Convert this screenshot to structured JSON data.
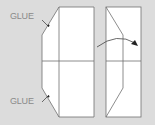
{
  "diagram": {
    "labels": {
      "glue_top": "GLUE",
      "glue_bottom": "GLUE"
    },
    "colors": {
      "background": "#dcdcdc",
      "paper": "#ffffff",
      "line": "#707070",
      "label": "#8a8a8a",
      "arrow": "#222222"
    },
    "panels": [
      {
        "name": "unfolded-sheet-with-glue-flaps"
      },
      {
        "name": "folded-sheet"
      }
    ],
    "annotation": "curved fold arrow"
  }
}
